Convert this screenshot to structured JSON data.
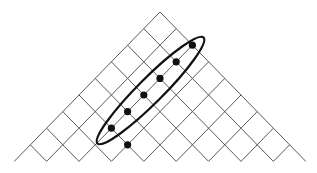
{
  "diagram": {
    "type": "triangular-lattice",
    "apex": [
      160,
      12
    ],
    "step": [
      16.2,
      16.6
    ],
    "size": 9,
    "colors": {
      "grid": "#5a5a5a",
      "dots": "#111111",
      "ellipse": "#111111",
      "background": "#ffffff"
    },
    "dots": [
      {
        "i": 0,
        "j": 2
      },
      {
        "i": 1,
        "j": 2
      },
      {
        "i": 2,
        "j": 2
      },
      {
        "i": 3,
        "j": 2
      },
      {
        "i": 4,
        "j": 2
      },
      {
        "i": 5,
        "j": 2
      },
      {
        "i": 5,
        "j": 3
      }
    ],
    "dot_radius": 3.6,
    "ellipse": {
      "cx": 150.5,
      "cy": 90.5,
      "rx": 75,
      "ry": 12.5,
      "rotation": -45
    }
  }
}
